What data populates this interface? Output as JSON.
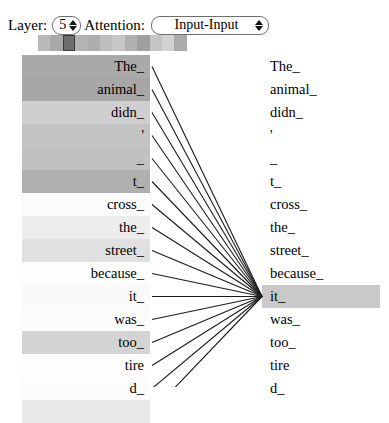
{
  "controls": {
    "layer_label": "Layer:",
    "layer_value": "5",
    "attention_label": "Attention:",
    "attention_value": "Input-Input",
    "attention_options": [
      "Input-Input"
    ],
    "spinner_up_icon": "caret-up-icon",
    "spinner_down_icon": "caret-down-icon",
    "select_arrows_icon": "caret-updown-icon"
  },
  "head_strip": {
    "selected_index": 2,
    "colors": [
      "#b9b9b9",
      "#a8a8a8",
      "#6e6e6e",
      "#b3b3b3",
      "#aeaeae",
      "#bdbdbd",
      "#c6c6c6",
      "#b0b0b0",
      "#9f9f9f",
      "#c4c4c4",
      "#d2d2d2",
      "#ababab"
    ]
  },
  "left_column": {
    "tokens": [
      {
        "text": "The_",
        "weight_color": "#a9a9a9"
      },
      {
        "text": "animal_",
        "weight_color": "#a7a7a7"
      },
      {
        "text": "didn_",
        "weight_color": "#cfcfcf"
      },
      {
        "text": "'",
        "weight_color": "#c3c3c3"
      },
      {
        "text": "_",
        "weight_color": "#c0c0c0"
      },
      {
        "text": "t_",
        "weight_color": "#b0b0b0"
      },
      {
        "text": "cross_",
        "weight_color": "#fbfbfb"
      },
      {
        "text": "the_",
        "weight_color": "#ededed"
      },
      {
        "text": "street_",
        "weight_color": "#e0e0e0"
      },
      {
        "text": "because_",
        "weight_color": "#fdfdfd"
      },
      {
        "text": "it_",
        "weight_color": "#fafafa"
      },
      {
        "text": "was_",
        "weight_color": "#fcfcfc"
      },
      {
        "text": "too_",
        "weight_color": "#d4d4d4"
      },
      {
        "text": "tire",
        "weight_color": "#fdfdfd"
      },
      {
        "text": "d_",
        "weight_color": "#fcfcfc"
      },
      {
        "text": "",
        "weight_color": "#e9e9e9"
      }
    ]
  },
  "right_column": {
    "tokens": [
      {
        "text": "The_",
        "weight_color": "#ffffff"
      },
      {
        "text": "animal_",
        "weight_color": "#ffffff"
      },
      {
        "text": "didn_",
        "weight_color": "#ffffff"
      },
      {
        "text": "'",
        "weight_color": "#ffffff"
      },
      {
        "text": "_",
        "weight_color": "#ffffff"
      },
      {
        "text": "t_",
        "weight_color": "#ffffff"
      },
      {
        "text": "cross_",
        "weight_color": "#ffffff"
      },
      {
        "text": "the_",
        "weight_color": "#ffffff"
      },
      {
        "text": "street_",
        "weight_color": "#ffffff"
      },
      {
        "text": "because_",
        "weight_color": "#ffffff"
      },
      {
        "text": "it_",
        "weight_color": "#c9c9c9"
      },
      {
        "text": "was_",
        "weight_color": "#ffffff"
      },
      {
        "text": "too_",
        "weight_color": "#ffffff"
      },
      {
        "text": "tire",
        "weight_color": "#ffffff"
      },
      {
        "text": "d_",
        "weight_color": "#ffffff"
      }
    ]
  },
  "chart_data": {
    "type": "heatmap",
    "layer": 5,
    "selected_head": 2,
    "focus_token": "it_",
    "source_tokens": [
      "The_",
      "animal_",
      "didn_",
      "'",
      "_",
      "t_",
      "cross_",
      "the_",
      "street_",
      "because_",
      "it_",
      "was_",
      "too_",
      "tire",
      "d_"
    ],
    "target_tokens": [
      "The_",
      "animal_",
      "didn_",
      "'",
      "_",
      "t_",
      "cross_",
      "the_",
      "street_",
      "because_",
      "it_",
      "was_",
      "too_",
      "tire",
      "d_"
    ],
    "attention_weights_to_it": [
      0.66,
      0.67,
      0.33,
      0.42,
      0.45,
      0.58,
      0.03,
      0.1,
      0.17,
      0.01,
      0.02,
      0.02,
      0.28,
      0.01,
      0.02
    ],
    "legend": "line opacity and token shading encode attention weight"
  }
}
